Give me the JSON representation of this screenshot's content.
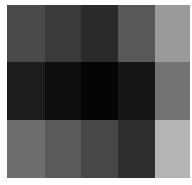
{
  "chart_data": {
    "type": "heatmap",
    "title": "",
    "xlabel": "",
    "ylabel": "",
    "rows": 3,
    "cols": 5,
    "colormap": "grayscale",
    "values": [
      [
        0.29,
        0.23,
        0.16,
        0.35,
        0.6
      ],
      [
        0.11,
        0.05,
        0.02,
        0.09,
        0.45
      ],
      [
        0.43,
        0.35,
        0.28,
        0.18,
        0.71
      ]
    ],
    "colors": [
      [
        "#4a4a4a",
        "#3a3a3a",
        "#2a2a2a",
        "#585858",
        "#9a9a9a"
      ],
      [
        "#1c1c1c",
        "#0d0d0d",
        "#050505",
        "#161616",
        "#737373"
      ],
      [
        "#6e6e6e",
        "#5a5a5a",
        "#474747",
        "#2e2e2e",
        "#b4b4b4"
      ]
    ],
    "grid": false,
    "legend": null
  }
}
